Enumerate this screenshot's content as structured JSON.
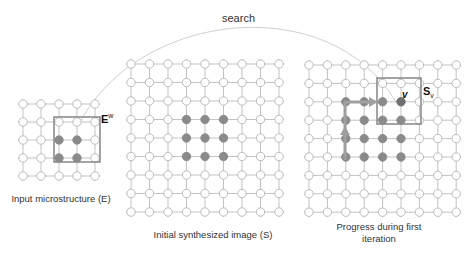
{
  "search_label": "search",
  "colors": {
    "grid_line": "#b4b4b4",
    "node_stroke": "#b4b4b4",
    "node_fill_empty": "#ffffff",
    "node_fill_filled": "#8a8a8a",
    "node_fill_current": "#6e6e6e",
    "box_stroke": "#8c8c8c",
    "arc_stroke": "#d0d0d0",
    "path_arrow": "#a0a0a0"
  },
  "grids": [
    {
      "id": "input",
      "caption": "Input microstructure (E)",
      "origin": [
        23,
        104
      ],
      "spacing": 18,
      "cols": 5,
      "rows": 5,
      "filled": [
        [
          2,
          2
        ],
        [
          3,
          2
        ],
        [
          2,
          3
        ],
        [
          3,
          3
        ]
      ],
      "current": [],
      "window": {
        "x": 54,
        "y": 117,
        "w": 46,
        "h": 45,
        "label": "E",
        "label_sup": "w"
      }
    },
    {
      "id": "initial",
      "caption": "Initial  synthesized image (S)",
      "origin": [
        131,
        64
      ],
      "spacing": 18.5,
      "cols": 9,
      "rows": 9,
      "filled": [
        [
          3,
          3
        ],
        [
          4,
          3
        ],
        [
          5,
          3
        ],
        [
          3,
          4
        ],
        [
          4,
          4
        ],
        [
          5,
          4
        ],
        [
          3,
          5
        ],
        [
          4,
          5
        ],
        [
          5,
          5
        ]
      ],
      "current": []
    },
    {
      "id": "progress",
      "caption_line1": "Progress during first",
      "caption_line2": "iteration",
      "origin": [
        309,
        65
      ],
      "spacing": 18.4,
      "cols": 9,
      "rows": 9,
      "filled": [
        [
          2,
          2
        ],
        [
          3,
          2
        ],
        [
          4,
          2
        ],
        [
          2,
          3
        ],
        [
          3,
          3
        ],
        [
          4,
          3
        ],
        [
          5,
          3
        ],
        [
          2,
          4
        ],
        [
          3,
          4
        ],
        [
          4,
          4
        ],
        [
          5,
          4
        ],
        [
          2,
          5
        ],
        [
          3,
          5
        ],
        [
          4,
          5
        ],
        [
          5,
          5
        ]
      ],
      "current": [
        [
          5,
          2
        ]
      ],
      "window": {
        "x": 377,
        "y": 78,
        "w": 44,
        "h": 46,
        "label": "S",
        "label_sub": "v"
      },
      "node_label": "v"
    }
  ]
}
